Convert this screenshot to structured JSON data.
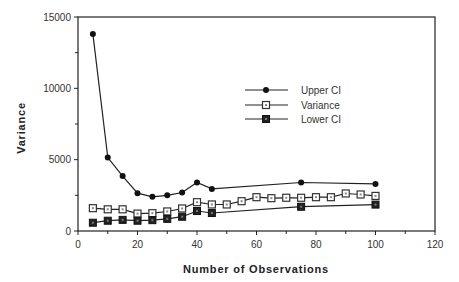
{
  "chart_data": {
    "type": "line",
    "title": "",
    "xlabel": "Number  of  Observations",
    "ylabel": "Variance",
    "xlim": [
      0,
      120
    ],
    "ylim": [
      0,
      15000
    ],
    "x_ticks": [
      0,
      20,
      40,
      60,
      80,
      100,
      120
    ],
    "y_ticks": [
      0,
      5000,
      10000,
      15000
    ],
    "grid": false,
    "legend_position": "inside-center-right",
    "series": [
      {
        "name": "Upper CI",
        "marker": "filled-diamond",
        "x": [
          5,
          10,
          15,
          20,
          25,
          30,
          35,
          40,
          45,
          75,
          100
        ],
        "values": [
          13800,
          5150,
          3850,
          2650,
          2400,
          2500,
          2700,
          3400,
          2950,
          3400,
          3300
        ]
      },
      {
        "name": "Variance",
        "marker": "open-square",
        "x": [
          5,
          10,
          15,
          20,
          25,
          30,
          35,
          40,
          45,
          50,
          55,
          60,
          65,
          70,
          75,
          80,
          85,
          90,
          95,
          100
        ],
        "values": [
          1600,
          1520,
          1520,
          1220,
          1250,
          1370,
          1580,
          2020,
          1860,
          1860,
          2090,
          2370,
          2300,
          2330,
          2330,
          2370,
          2370,
          2630,
          2560,
          2460
        ]
      },
      {
        "name": "Lower CI",
        "marker": "filled-square",
        "x": [
          5,
          10,
          15,
          20,
          25,
          30,
          35,
          40,
          45,
          75,
          100
        ],
        "values": [
          580,
          720,
          780,
          720,
          760,
          850,
          1000,
          1400,
          1260,
          1700,
          1850
        ]
      }
    ]
  }
}
